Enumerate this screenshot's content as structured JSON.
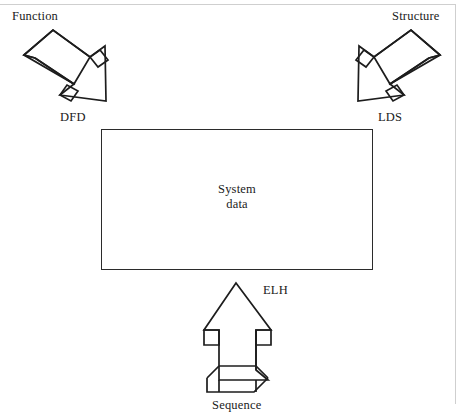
{
  "diagram": {
    "central_box": {
      "label": "System\ndata"
    },
    "labels": {
      "function": "Function",
      "structure": "Structure",
      "dfd": "DFD",
      "lds": "LDS",
      "elh": "ELH",
      "sequence": "Sequence"
    },
    "arrows": [
      {
        "name": "function-dfd-arrow",
        "from": "Function",
        "to": "System data",
        "technique": "DFD",
        "direction": "down-right",
        "style": "3d-block-arrow"
      },
      {
        "name": "structure-lds-arrow",
        "from": "Structure",
        "to": "System data",
        "technique": "LDS",
        "direction": "down-left",
        "style": "3d-block-arrow"
      },
      {
        "name": "sequence-elh-arrow",
        "from": "Sequence",
        "to": "System data",
        "technique": "ELH",
        "direction": "up",
        "style": "3d-block-arrow"
      }
    ],
    "colors": {
      "stroke": "#1d1d1d",
      "fill": "#ffffff",
      "text": "#1a1a1a",
      "background": "#ffffff",
      "scan_rule": "#cfcfcf"
    }
  }
}
